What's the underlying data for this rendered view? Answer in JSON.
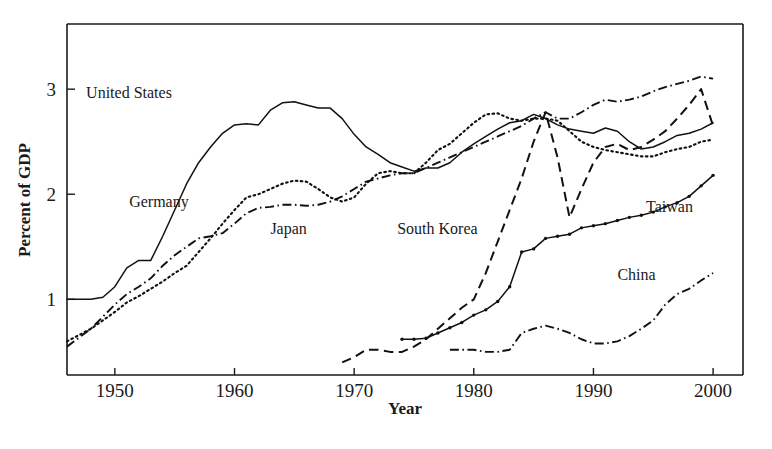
{
  "chart_data": {
    "type": "line",
    "title": "",
    "xlabel": "Year",
    "ylabel": "Percent of GDP",
    "xlim": [
      1946,
      2002.5
    ],
    "ylim": [
      0.28,
      3.62
    ],
    "grid": false,
    "legend_position": "inline-annotations",
    "x_ticks": [
      1950,
      1960,
      1970,
      1980,
      1990,
      2000
    ],
    "x_tick_labels": [
      "1950",
      "1960",
      "1970",
      "1980",
      "1990",
      "2000"
    ],
    "y_ticks": [
      1,
      2,
      3
    ],
    "y_tick_labels": [
      "1",
      "2",
      "3"
    ],
    "series": [
      {
        "name": "United States",
        "label": "United States",
        "style": "solid",
        "markers": false,
        "label_x": 1947.6,
        "label_y": 2.92,
        "x": [
          1946,
          1947,
          1948,
          1949,
          1950,
          1951,
          1952,
          1953,
          1954,
          1955,
          1956,
          1957,
          1958,
          1959,
          1960,
          1961,
          1962,
          1963,
          1964,
          1965,
          1966,
          1967,
          1968,
          1969,
          1970,
          1971,
          1972,
          1973,
          1974,
          1975,
          1976,
          1977,
          1978,
          1979,
          1980,
          1981,
          1982,
          1983,
          1984,
          1985,
          1986,
          1987,
          1988,
          1989,
          1990,
          1991,
          1992,
          1993,
          1994,
          1995,
          1996,
          1997,
          1998,
          1999,
          2000
        ],
        "y": [
          1.0,
          1.0,
          1.0,
          1.02,
          1.12,
          1.3,
          1.37,
          1.37,
          1.6,
          1.85,
          2.1,
          2.3,
          2.45,
          2.58,
          2.66,
          2.67,
          2.66,
          2.8,
          2.87,
          2.88,
          2.85,
          2.82,
          2.82,
          2.72,
          2.57,
          2.45,
          2.38,
          2.3,
          2.26,
          2.22,
          2.25,
          2.25,
          2.3,
          2.4,
          2.48,
          2.55,
          2.62,
          2.68,
          2.7,
          2.76,
          2.72,
          2.66,
          2.62,
          2.6,
          2.58,
          2.63,
          2.6,
          2.5,
          2.43,
          2.45,
          2.5,
          2.56,
          2.58,
          2.62,
          2.68
        ]
      },
      {
        "name": "Germany",
        "label": "Germany",
        "style": "dotted",
        "markers": false,
        "label_x": 1951.2,
        "label_y": 1.88,
        "x": [
          1946,
          1948,
          1950,
          1951,
          1952,
          1953,
          1954,
          1955,
          1956,
          1957,
          1958,
          1959,
          1960,
          1961,
          1962,
          1963,
          1964,
          1965,
          1966,
          1967,
          1968,
          1969,
          1970,
          1971,
          1972,
          1973,
          1974,
          1975,
          1976,
          1977,
          1978,
          1979,
          1980,
          1981,
          1982,
          1983,
          1984,
          1985,
          1986,
          1987,
          1988,
          1989,
          1990,
          1991,
          1992,
          1993,
          1994,
          1995,
          1996,
          1997,
          1998,
          1999,
          2000
        ],
        "y": [
          0.6,
          0.72,
          0.88,
          0.97,
          1.03,
          1.1,
          1.17,
          1.25,
          1.32,
          1.45,
          1.58,
          1.72,
          1.85,
          1.97,
          2.0,
          2.05,
          2.1,
          2.13,
          2.12,
          2.05,
          1.97,
          1.93,
          1.97,
          2.1,
          2.2,
          2.22,
          2.2,
          2.2,
          2.3,
          2.42,
          2.48,
          2.58,
          2.68,
          2.76,
          2.77,
          2.72,
          2.7,
          2.72,
          2.72,
          2.7,
          2.6,
          2.5,
          2.45,
          2.42,
          2.4,
          2.38,
          2.36,
          2.36,
          2.4,
          2.43,
          2.45,
          2.5,
          2.52
        ]
      },
      {
        "name": "Japan",
        "label": "Japan",
        "style": "dashdot",
        "markers": false,
        "label_x": 1963.0,
        "label_y": 1.62,
        "x": [
          1946,
          1948,
          1950,
          1951,
          1952,
          1953,
          1954,
          1955,
          1956,
          1957,
          1958,
          1959,
          1960,
          1961,
          1962,
          1963,
          1964,
          1965,
          1966,
          1967,
          1968,
          1969,
          1970,
          1971,
          1972,
          1973,
          1974,
          1975,
          1976,
          1977,
          1978,
          1979,
          1980,
          1981,
          1982,
          1983,
          1984,
          1985,
          1986,
          1987,
          1988,
          1989,
          1990,
          1991,
          1992,
          1993,
          1994,
          1995,
          1996,
          1997,
          1998,
          1999,
          2000
        ],
        "y": [
          0.55,
          0.72,
          0.95,
          1.05,
          1.12,
          1.2,
          1.32,
          1.42,
          1.5,
          1.58,
          1.6,
          1.63,
          1.72,
          1.82,
          1.87,
          1.88,
          1.9,
          1.9,
          1.89,
          1.9,
          1.93,
          1.98,
          2.05,
          2.12,
          2.15,
          2.18,
          2.2,
          2.2,
          2.25,
          2.3,
          2.35,
          2.4,
          2.45,
          2.5,
          2.55,
          2.6,
          2.65,
          2.72,
          2.78,
          2.72,
          2.72,
          2.78,
          2.85,
          2.9,
          2.88,
          2.9,
          2.93,
          2.98,
          3.02,
          3.05,
          3.08,
          3.12,
          3.1
        ]
      },
      {
        "name": "South Korea",
        "label": "South Korea",
        "style": "dashed",
        "markers": false,
        "label_x": 1973.6,
        "label_y": 1.62,
        "x": [
          1969,
          1970,
          1971,
          1972,
          1973,
          1974,
          1975,
          1976,
          1977,
          1978,
          1979,
          1980,
          1981,
          1982,
          1983,
          1984,
          1985,
          1986,
          1987,
          1988,
          1989,
          1990,
          1991,
          1992,
          1993,
          1994,
          1995,
          1996,
          1997,
          1998,
          1999,
          2000
        ],
        "y": [
          0.4,
          0.45,
          0.52,
          0.52,
          0.5,
          0.5,
          0.55,
          0.62,
          0.72,
          0.82,
          0.92,
          1.0,
          1.25,
          1.55,
          1.85,
          2.15,
          2.5,
          2.78,
          2.35,
          1.78,
          2.05,
          2.3,
          2.45,
          2.48,
          2.42,
          2.45,
          2.52,
          2.6,
          2.72,
          2.85,
          3.0,
          2.65
        ]
      },
      {
        "name": "Taiwan",
        "label": "Taiwan",
        "style": "solid",
        "markers": true,
        "label_x": 1994.4,
        "label_y": 1.83,
        "x": [
          1974,
          1975,
          1976,
          1977,
          1978,
          1979,
          1980,
          1981,
          1982,
          1983,
          1984,
          1985,
          1986,
          1987,
          1988,
          1989,
          1990,
          1991,
          1992,
          1993,
          1994,
          1995,
          1996,
          1997,
          1998,
          1999,
          2000
        ],
        "y": [
          0.62,
          0.62,
          0.63,
          0.68,
          0.73,
          0.78,
          0.85,
          0.9,
          0.98,
          1.12,
          1.45,
          1.48,
          1.58,
          1.6,
          1.62,
          1.68,
          1.7,
          1.72,
          1.75,
          1.78,
          1.8,
          1.83,
          1.88,
          1.92,
          1.98,
          2.08,
          2.18
        ]
      },
      {
        "name": "China",
        "label": "China",
        "style": "dashdot",
        "markers": false,
        "label_x": 1992.0,
        "label_y": 1.18,
        "x": [
          1978,
          1979,
          1980,
          1981,
          1982,
          1983,
          1984,
          1985,
          1986,
          1987,
          1988,
          1989,
          1990,
          1991,
          1992,
          1993,
          1994,
          1995,
          1996,
          1997,
          1998,
          1999,
          2000
        ],
        "y": [
          0.52,
          0.52,
          0.52,
          0.5,
          0.5,
          0.52,
          0.68,
          0.72,
          0.75,
          0.72,
          0.68,
          0.62,
          0.58,
          0.58,
          0.6,
          0.65,
          0.72,
          0.8,
          0.95,
          1.05,
          1.1,
          1.18,
          1.25
        ]
      }
    ]
  },
  "axes": {
    "y_title": "Percent of GDP",
    "x_title": "Year"
  }
}
